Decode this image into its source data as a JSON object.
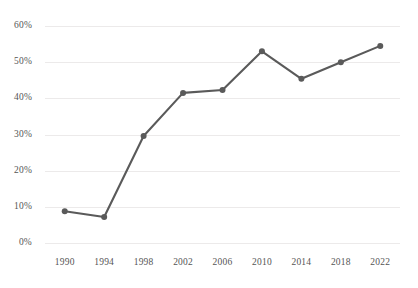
{
  "chart_data": {
    "type": "line",
    "title": "",
    "subtitle": "",
    "xlabel": "",
    "ylabel": "",
    "categories": [
      "1990",
      "1994",
      "1998",
      "2002",
      "2006",
      "2010",
      "2014",
      "2018",
      "2022"
    ],
    "x": [
      1990,
      1994,
      1998,
      2002,
      2006,
      2010,
      2014,
      2018,
      2022
    ],
    "values": [
      8.8,
      7.2,
      29.6,
      41.5,
      42.3,
      53.0,
      45.4,
      50.0,
      54.5
    ],
    "series": [
      {
        "name": "",
        "values": [
          8.8,
          7.2,
          29.6,
          41.5,
          42.3,
          53.0,
          45.4,
          50.0,
          54.5
        ]
      }
    ],
    "ylim": [
      0,
      60
    ],
    "ytick_labels": [
      "0%",
      "10%",
      "20%",
      "30%",
      "40%",
      "50%",
      "60%"
    ],
    "ytick_values": [
      0,
      10,
      20,
      30,
      40,
      50,
      60
    ],
    "xtick_labels": [
      "1990",
      "1994",
      "1998",
      "2002",
      "2006",
      "2010",
      "2014",
      "2018",
      "2022"
    ],
    "grid": true,
    "legend": "none",
    "annotations": [],
    "style": {
      "line_color": "#5a5a5a",
      "marker_color": "#5a5a5a",
      "grid_color": "#eceaea",
      "tick_label_color": "#555555",
      "background": "#ffffff",
      "line_width": 2.1,
      "marker_radius": 3.0
    }
  }
}
